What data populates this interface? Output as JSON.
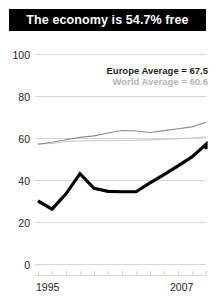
{
  "title": {
    "text": "The economy is 54.7% free"
  },
  "legend": {
    "europe_label": "Europe Average = 67.5",
    "world_label": "World Average = 60.6"
  },
  "axis": {
    "y_ticks": [
      "100",
      "80",
      "60",
      "40",
      "20",
      "0"
    ],
    "x_start": "1995",
    "x_end": "2007"
  },
  "colors": {
    "title_bar": "#000000",
    "title_text": "#ffffff",
    "country_line": "#000000",
    "europe_line": "#8c8c8c",
    "world_line": "#c8c8c8",
    "gridline": "#d7d7d7",
    "tick_text": "#231f20",
    "legend_europe_text": "#231f20",
    "legend_world_text": "#b4b4b4"
  },
  "chart_data": {
    "type": "line",
    "title": "The economy is 54.7% free",
    "xlabel": "",
    "ylabel": "",
    "xlim": [
      1995,
      2007
    ],
    "ylim": [
      0,
      100
    ],
    "grid": true,
    "legend_position": "upper-right",
    "x": [
      1995,
      1996,
      1997,
      1998,
      1999,
      2000,
      2001,
      2002,
      2003,
      2004,
      2005,
      2006,
      2007
    ],
    "y_ticks": [
      0,
      20,
      40,
      60,
      80,
      100
    ],
    "x_tick_labels": [
      "1995",
      "",
      "",
      "",
      "",
      "",
      "",
      "",
      "",
      "",
      "",
      "",
      "2007"
    ],
    "series": [
      {
        "name": "Country",
        "color": "#000000",
        "values": [
          30.0,
          26.1,
          33.4,
          43.0,
          36.0,
          34.6,
          34.4,
          34.4,
          38.6,
          42.6,
          46.7,
          51.0,
          57.0,
          54.7
        ],
        "x": [
          1995,
          1996,
          1997,
          1998,
          1999,
          2000,
          2001,
          2002,
          2003,
          2004,
          2005,
          2006,
          2007,
          2007
        ],
        "final_value": 54.7
      },
      {
        "name": "Europe Average",
        "color": "#8c8c8c",
        "values": [
          57.0,
          58.0,
          59.2,
          60.3,
          61.0,
          62.4,
          63.6,
          63.3,
          62.6,
          63.5,
          64.4,
          65.3,
          67.5
        ],
        "final_value": 67.5
      },
      {
        "name": "World Average",
        "color": "#c8c8c8",
        "values": [
          57.2,
          57.4,
          58.3,
          58.6,
          58.7,
          58.7,
          58.8,
          58.9,
          59.1,
          59.4,
          59.7,
          60.0,
          60.6
        ],
        "final_value": 60.6
      }
    ],
    "annotations": [
      {
        "text": "Europe Average = 67.5",
        "color": "#231f20"
      },
      {
        "text": "World Average = 60.6",
        "color": "#b4b4b4"
      }
    ]
  }
}
